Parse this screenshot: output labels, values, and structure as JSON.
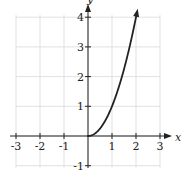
{
  "chart_data": {
    "type": "line",
    "title": "",
    "xlabel": "x",
    "ylabel": "y",
    "xlim": [
      -3,
      3
    ],
    "ylim": [
      -1,
      4
    ],
    "grid": true,
    "x_ticks": [
      -3,
      -2,
      -1,
      1,
      2,
      3
    ],
    "y_ticks": [
      -1,
      1,
      2,
      3,
      4
    ],
    "x_tick_labels": [
      "-3",
      "-2",
      "-1",
      "1",
      "2",
      "3"
    ],
    "y_tick_labels": [
      "-1",
      "1",
      "2",
      "3",
      "4"
    ],
    "series": [
      {
        "name": "y = x^2 (x >= 0)",
        "x": [
          0,
          0.25,
          0.5,
          0.75,
          1,
          1.25,
          1.5,
          1.75,
          2,
          2.05
        ],
        "y": [
          0,
          0.0625,
          0.25,
          0.5625,
          1,
          1.5625,
          2.25,
          3.0625,
          4,
          4.2
        ],
        "color": "#222222",
        "end_arrow": true
      }
    ],
    "colors": {
      "grid": "#d9d9d9",
      "axis": "#222222",
      "curve": "#222222"
    }
  }
}
